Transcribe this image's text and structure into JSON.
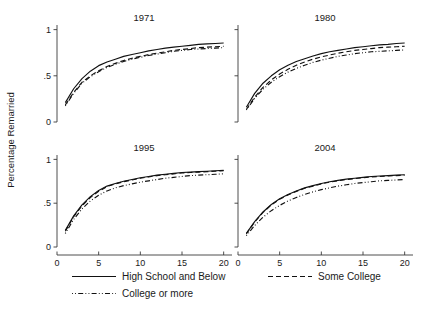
{
  "figure": {
    "ylabel": "Percentage Remarried",
    "xlabel": ""
  },
  "legend": {
    "items": [
      {
        "label": "High School and Below",
        "style": "solid",
        "name": "legend-high-school-and-below"
      },
      {
        "label": "Some College",
        "style": "dashed",
        "name": "legend-some-college"
      },
      {
        "label": "College or more",
        "style": "dotdash",
        "name": "legend-college-or-more"
      }
    ]
  },
  "chart_data": {
    "type": "line",
    "title": "",
    "subtitle": "",
    "xlabel": "",
    "ylabel": "Percentage Remarried",
    "xlim": [
      0,
      21
    ],
    "ylim": [
      0,
      1.05
    ],
    "xticks": [
      0,
      5,
      10,
      15,
      20
    ],
    "xtick_labels": [
      "0",
      "5",
      "10",
      "15",
      "20"
    ],
    "yticks": [
      0,
      0.5,
      1
    ],
    "ytick_labels": [
      "0",
      ".5",
      "1"
    ],
    "grid": false,
    "legend_position": "bottom",
    "panel_layout": "2x2",
    "panels": [
      {
        "title": "1971",
        "x": [
          1,
          2,
          3,
          4,
          5,
          6,
          7,
          8,
          9,
          10,
          11,
          12,
          13,
          14,
          15,
          16,
          17,
          18,
          19,
          20
        ],
        "series": [
          {
            "name": "High School and Below",
            "style": "solid",
            "values": [
              0.21,
              0.36,
              0.47,
              0.55,
              0.61,
              0.65,
              0.68,
              0.71,
              0.73,
              0.75,
              0.77,
              0.785,
              0.8,
              0.81,
              0.82,
              0.83,
              0.84,
              0.845,
              0.85,
              0.855
            ]
          },
          {
            "name": "Some College",
            "style": "dashed",
            "values": [
              0.185,
              0.32,
              0.43,
              0.5,
              0.555,
              0.6,
              0.635,
              0.665,
              0.69,
              0.71,
              0.73,
              0.745,
              0.76,
              0.775,
              0.785,
              0.795,
              0.805,
              0.81,
              0.815,
              0.82
            ]
          },
          {
            "name": "College or more",
            "style": "dotdash",
            "values": [
              0.175,
              0.31,
              0.42,
              0.49,
              0.545,
              0.59,
              0.625,
              0.655,
              0.68,
              0.7,
              0.72,
              0.735,
              0.75,
              0.765,
              0.775,
              0.785,
              0.79,
              0.795,
              0.8,
              0.805
            ]
          }
        ]
      },
      {
        "title": "1980",
        "x": [
          1,
          2,
          3,
          4,
          5,
          6,
          7,
          8,
          9,
          10,
          11,
          12,
          13,
          14,
          15,
          16,
          17,
          18,
          19,
          20
        ],
        "series": [
          {
            "name": "High School and Below",
            "style": "solid",
            "values": [
              0.16,
              0.31,
              0.42,
              0.5,
              0.565,
              0.615,
              0.655,
              0.685,
              0.715,
              0.74,
              0.76,
              0.775,
              0.79,
              0.805,
              0.815,
              0.825,
              0.835,
              0.84,
              0.85,
              0.855
            ]
          },
          {
            "name": "Some College",
            "style": "dashed",
            "values": [
              0.135,
              0.27,
              0.375,
              0.455,
              0.52,
              0.57,
              0.615,
              0.65,
              0.68,
              0.705,
              0.725,
              0.745,
              0.76,
              0.775,
              0.785,
              0.795,
              0.805,
              0.81,
              0.815,
              0.82
            ]
          },
          {
            "name": "College or more",
            "style": "dotdash",
            "values": [
              0.13,
              0.255,
              0.355,
              0.43,
              0.49,
              0.54,
              0.58,
              0.615,
              0.645,
              0.67,
              0.69,
              0.71,
              0.725,
              0.74,
              0.75,
              0.76,
              0.765,
              0.77,
              0.775,
              0.78
            ]
          }
        ]
      },
      {
        "title": "1995",
        "x": [
          1,
          2,
          3,
          4,
          5,
          6,
          7,
          8,
          9,
          10,
          11,
          12,
          13,
          14,
          15,
          16,
          17,
          18,
          19,
          20
        ],
        "series": [
          {
            "name": "High School and Below",
            "style": "solid",
            "values": [
              0.19,
              0.355,
              0.48,
              0.575,
              0.645,
              0.695,
              0.725,
              0.75,
              0.77,
              0.79,
              0.805,
              0.82,
              0.83,
              0.84,
              0.85,
              0.855,
              0.86,
              0.865,
              0.87,
              0.875
            ]
          },
          {
            "name": "Some College",
            "style": "dashed",
            "values": [
              0.18,
              0.345,
              0.47,
              0.565,
              0.635,
              0.69,
              0.72,
              0.745,
              0.765,
              0.785,
              0.8,
              0.815,
              0.825,
              0.835,
              0.845,
              0.85,
              0.855,
              0.86,
              0.865,
              0.87
            ]
          },
          {
            "name": "College or more",
            "style": "dotdash",
            "values": [
              0.155,
              0.315,
              0.435,
              0.525,
              0.59,
              0.64,
              0.675,
              0.7,
              0.72,
              0.74,
              0.755,
              0.77,
              0.785,
              0.795,
              0.805,
              0.815,
              0.82,
              0.825,
              0.83,
              0.835
            ]
          }
        ]
      },
      {
        "title": "2004",
        "x": [
          1,
          2,
          3,
          4,
          5,
          6,
          7,
          8,
          9,
          10,
          11,
          12,
          13,
          14,
          15,
          16,
          17,
          18,
          19,
          20
        ],
        "series": [
          {
            "name": "High School and Below",
            "style": "solid",
            "values": [
              0.155,
              0.29,
              0.4,
              0.485,
              0.55,
              0.6,
              0.64,
              0.675,
              0.7,
              0.725,
              0.745,
              0.76,
              0.775,
              0.785,
              0.795,
              0.805,
              0.81,
              0.815,
              0.82,
              0.825
            ]
          },
          {
            "name": "Some College",
            "style": "dashed",
            "values": [
              0.15,
              0.285,
              0.395,
              0.48,
              0.545,
              0.595,
              0.635,
              0.67,
              0.695,
              0.72,
              0.74,
              0.755,
              0.77,
              0.78,
              0.79,
              0.8,
              0.805,
              0.81,
              0.815,
              0.82
            ]
          },
          {
            "name": "College or more",
            "style": "dotdash",
            "values": [
              0.13,
              0.245,
              0.34,
              0.415,
              0.475,
              0.525,
              0.565,
              0.6,
              0.63,
              0.655,
              0.675,
              0.695,
              0.71,
              0.725,
              0.735,
              0.745,
              0.755,
              0.76,
              0.765,
              0.77
            ]
          }
        ]
      }
    ]
  }
}
